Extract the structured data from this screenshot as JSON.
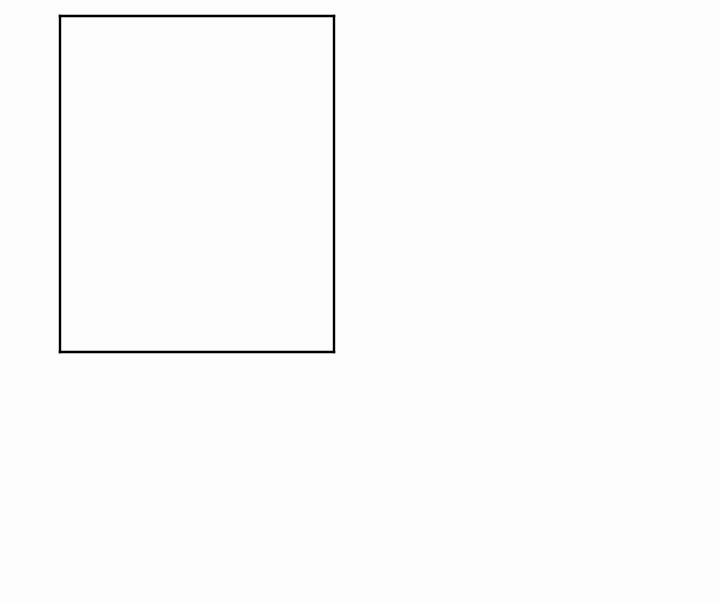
{
  "figure": {
    "background_color": "#fdfdfd",
    "ink_color": "#000000",
    "x_axis_title": "SOUND PRESSURE LEVEL IN dB",
    "y_axis_title": "SPIKES/SEC",
    "panel_letters": {
      "a": "A",
      "b": "B",
      "c": "C",
      "d": "D"
    },
    "panel_titles": {
      "a": "STEADY STATE",
      "b": "ONSET   2 MS"
    },
    "xticklabels": [
      "0",
      "20",
      "40",
      "60"
    ],
    "xtickvalues": [
      0,
      20,
      40,
      60
    ],
    "yticklabels_a": [
      "0",
      "25",
      "50",
      "75",
      "100",
      "125"
    ],
    "yticklabels_b": [
      "0",
      "100",
      "200",
      "300",
      "400",
      "500",
      "600"
    ],
    "yticklabels_cd": [
      "0",
      "50"
    ]
  },
  "chart_data": [
    {
      "id": "panel-a",
      "type": "scatter",
      "title": "STEADY STATE",
      "panel_label": "A",
      "xlabel": "SOUND PRESSURE LEVEL IN dB",
      "ylabel": "SPIKES/SEC",
      "xlim": [
        -10,
        70
      ],
      "ylim": [
        0,
        125
      ],
      "xticks": [
        -10,
        0,
        10,
        20,
        30,
        40,
        50,
        60,
        70
      ],
      "xticklabels": [
        "",
        "0",
        "",
        "20",
        "",
        "40",
        "",
        "60",
        ""
      ],
      "yticks": [
        0,
        25,
        50,
        75,
        100,
        125
      ],
      "yticklabels": [
        "0",
        "25",
        "50",
        "75",
        "100",
        "125"
      ],
      "grid": false,
      "legend": "none",
      "marker": "plus",
      "series": [
        {
          "name": "steady state rate",
          "x": [
            -2,
            8,
            16,
            21,
            26,
            36,
            46,
            56
          ],
          "y": [
            41,
            69,
            87,
            85,
            93,
            97,
            97,
            98
          ]
        }
      ],
      "fit_curve": {
        "style": "solid",
        "description": "sigmoidal rate-level function, saturating near 98 spikes/sec",
        "x": [
          -10,
          -6,
          -2,
          2,
          6,
          10,
          14,
          18,
          22,
          26,
          30,
          34,
          38,
          42,
          46,
          50,
          54,
          58,
          62,
          66,
          70
        ],
        "y": [
          36,
          36.5,
          39,
          46,
          58,
          72,
          82,
          88,
          92,
          94.5,
          96,
          96.8,
          97.2,
          97.5,
          97.7,
          97.8,
          97.9,
          98,
          98,
          98,
          98
        ]
      }
    },
    {
      "id": "panel-b",
      "type": "scatter",
      "title": "ONSET   2 MS",
      "panel_label": "B",
      "xlabel": "SOUND PRESSURE LEVEL IN dB",
      "ylabel": "SPIKES/SEC",
      "xlim": [
        -10,
        70
      ],
      "ylim": [
        0,
        600
      ],
      "xticks": [
        -10,
        0,
        10,
        20,
        30,
        40,
        50,
        60,
        70
      ],
      "xticklabels": [
        "",
        "0",
        "",
        "20",
        "",
        "40",
        "",
        "60",
        ""
      ],
      "yticks": [
        0,
        100,
        200,
        300,
        400,
        500,
        600
      ],
      "yticklabels": [
        "0",
        "100",
        "200",
        "300",
        "400",
        "500",
        "600"
      ],
      "grid": false,
      "legend": "none",
      "marker": "plus",
      "series": [
        {
          "name": "onset rate (2 ms window)",
          "x": [
            -2,
            8,
            18,
            23,
            28,
            38,
            48,
            58
          ],
          "y": [
            100,
            150,
            287,
            277,
            327,
            415,
            438,
            441
          ]
        }
      ],
      "fit_curve": {
        "style": "solid",
        "description": "sigmoidal rate-level function, saturating near 445 spikes/sec",
        "x": [
          -10,
          -6,
          -2,
          2,
          6,
          10,
          14,
          18,
          22,
          26,
          30,
          34,
          38,
          42,
          46,
          50,
          54,
          58,
          62,
          66,
          70
        ],
        "y": [
          95,
          95,
          97,
          105,
          122,
          152,
          196,
          248,
          298,
          340,
          374,
          398,
          416,
          428,
          436,
          440,
          443,
          444,
          445,
          445,
          445
        ]
      }
    },
    {
      "id": "panel-c",
      "type": "scatter",
      "panel_label": "C",
      "xlabel": "SOUND PRESSURE LEVEL IN dB",
      "ylabel": "SPIKES/SEC",
      "xlim": [
        -10,
        70
      ],
      "ylim": [
        0,
        74
      ],
      "xticks": [
        -10,
        0,
        10,
        20,
        30,
        40,
        50,
        60,
        70
      ],
      "xticklabels": [
        "",
        "0",
        "",
        "20",
        "",
        "40",
        "",
        "60",
        ""
      ],
      "yticks": [
        0,
        25,
        50
      ],
      "yticklabels": [
        "0",
        "",
        "50"
      ],
      "grid": false,
      "legend": "none",
      "marker": "open-square",
      "series": [
        {
          "name": "steady-state difference function",
          "x": [
            -3,
            7,
            17,
            22,
            27,
            42,
            52,
            62
          ],
          "y": [
            5,
            20,
            33,
            37,
            28,
            13,
            11,
            2
          ]
        }
      ],
      "fit_curve": {
        "style": "dashed",
        "description": "derivative-like hump peaking near 7 dB at ~36 spikes/sec, decaying to near zero by 45 dB",
        "x": [
          -10,
          -8,
          -6,
          -4,
          -2,
          0,
          2,
          4,
          6,
          8,
          10,
          12,
          14,
          16,
          18,
          20,
          22,
          24,
          26,
          28,
          30,
          34,
          38,
          42,
          46,
          50,
          54,
          58,
          62,
          66,
          70
        ],
        "y": [
          4,
          5,
          7.5,
          11,
          16,
          21,
          27,
          32,
          35,
          36,
          35,
          32,
          28,
          23,
          18,
          14,
          11,
          8.5,
          6.5,
          5,
          4,
          2.6,
          1.8,
          1.2,
          0.9,
          0.7,
          0.5,
          0.4,
          0.3,
          0.3,
          0.2
        ]
      }
    },
    {
      "id": "panel-d",
      "type": "scatter",
      "panel_label": "D",
      "xlabel": "SOUND PRESSURE LEVEL IN dB",
      "ylabel": "SPIKES/SEC",
      "xlim": [
        -10,
        70
      ],
      "ylim": [
        0,
        74
      ],
      "xticks": [
        -10,
        0,
        10,
        20,
        30,
        40,
        50,
        60,
        70
      ],
      "xticklabels": [
        "",
        "0",
        "",
        "20",
        "",
        "40",
        "",
        "60",
        ""
      ],
      "yticks": [
        0,
        25,
        50
      ],
      "yticklabels": [
        "0",
        "",
        "50"
      ],
      "grid": false,
      "legend": "none",
      "marker": "open-square",
      "series": [
        {
          "name": "onset difference function",
          "x": [
            -1,
            9,
            18,
            23,
            29,
            43,
            54,
            63
          ],
          "y": [
            5,
            21,
            33,
            37,
            27,
            13,
            11,
            2
          ]
        }
      ],
      "fit_curve": {
        "style": "dashed",
        "description": "broad symmetric hump peaking near 18 dB at ~40 spikes/sec",
        "x": [
          -10,
          -8,
          -6,
          -4,
          -2,
          0,
          2,
          4,
          6,
          8,
          10,
          12,
          14,
          16,
          18,
          20,
          22,
          24,
          26,
          28,
          30,
          32,
          34,
          38,
          42,
          46,
          50,
          54,
          58,
          62,
          66,
          70
        ],
        "y": [
          0.5,
          0.8,
          1.5,
          2.6,
          4.2,
          6.5,
          10,
          14,
          19,
          24,
          29,
          34,
          37.5,
          39.5,
          40,
          39.5,
          38,
          35,
          31,
          27,
          23,
          19.5,
          16,
          11,
          7.5,
          5.2,
          3.6,
          2.5,
          1.7,
          1.1,
          0.8,
          0.6
        ]
      }
    }
  ]
}
